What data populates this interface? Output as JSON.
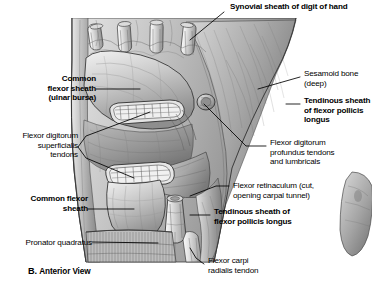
{
  "figure": {
    "caption_letter": "B.",
    "caption_text": "Anterior View",
    "type": "anatomical-illustration",
    "style": "grayscale pen-and-ink medical illustration",
    "background": "#ffffff",
    "ink": "#000000"
  },
  "labels": {
    "synovial_sheath_digit": "Synovial sheath of digit of hand",
    "common_flexor_sheath_ulnar": "Common\nflexor sheath\n(ulnar bursa)",
    "flexor_digitorum_superficialis": "Flexor digitorum\nsuperficialis\ntendons",
    "common_flexor_sheath": "Common flexor\nsheath",
    "pronator_quadratus": "Pronator quadratus",
    "sesamoid_bone": "Sesamoid bone\n(deep)",
    "tendinous_sheath_fpl_upper": "Tendinous sheath\nof flexor pollicis\nlongus",
    "flexor_digitorum_profundus": "Flexor digitorum\nprofundus tendons\nand lumbricals",
    "flexor_retinaculum": "Flexor retinaculum (cut,\nopening carpal tunnel)",
    "tendinous_sheath_fpl_lower": "Tendinous sheath of\nflexor pollicis longus",
    "flexor_carpi_radialis": "Flexor carpi\nradialis tendon"
  }
}
